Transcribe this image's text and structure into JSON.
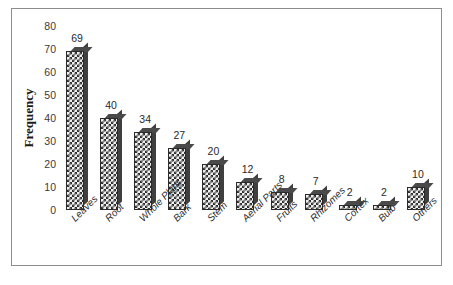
{
  "figure": {
    "caption_fragment": ""
  },
  "chart_data": {
    "type": "bar",
    "title": "",
    "xlabel": "",
    "ylabel": "Frequency",
    "categories": [
      "Leaves",
      "Root",
      "Whole Plant",
      "Bark",
      "Stem",
      "Aerial Parts",
      "Fruits",
      "Rhizomes",
      "Cortex",
      "Bulb",
      "Others"
    ],
    "values": [
      69,
      40,
      34,
      27,
      20,
      12,
      8,
      7,
      2,
      2,
      10
    ],
    "value_labels": [
      "69",
      "40",
      "34",
      "27",
      "20",
      "12",
      "8",
      "7",
      "2",
      "2",
      "10"
    ],
    "ylim": [
      0,
      80
    ],
    "yticks": [
      0,
      10,
      20,
      30,
      40,
      50,
      60,
      70,
      80
    ],
    "ytick_labels": [
      "0",
      "10",
      "20",
      "30",
      "40",
      "50",
      "60",
      "70",
      "80"
    ],
    "grid": false,
    "legend": false,
    "legend_position": "none",
    "bar_style": "3d-checkerboard",
    "xtick_rotation": -45,
    "colors": {
      "bar_fill_dark": "#2f2f2f",
      "bar_fill_light": "#efefef",
      "bar_top_face": "#4a4a4a",
      "bar_side_face": "#3f3f3f",
      "frame_border": "#8d8d8d",
      "text": "#2a2a2a",
      "background": "#ffffff"
    }
  }
}
